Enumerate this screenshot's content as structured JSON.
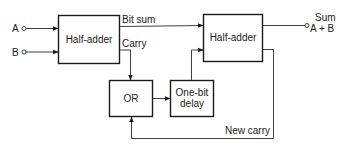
{
  "diagram": {
    "type": "block-diagram",
    "inputs": [
      {
        "id": "A",
        "label": "A"
      },
      {
        "id": "B",
        "label": "B"
      }
    ],
    "blocks": [
      {
        "id": "ha1",
        "label": "Half-adder"
      },
      {
        "id": "ha2",
        "label": "Half-adder"
      },
      {
        "id": "or",
        "label": "OR"
      },
      {
        "id": "delay",
        "label_line1": "One-bit",
        "label_line2": "delay"
      }
    ],
    "signals": {
      "bit_sum": "Bit sum",
      "carry": "Carry",
      "new_carry": "New carry"
    },
    "output": {
      "label_line1": "Sum",
      "label_line2": "A + B"
    },
    "edges": [
      {
        "from": "A",
        "to": "ha1"
      },
      {
        "from": "B",
        "to": "ha1"
      },
      {
        "from": "ha1",
        "to": "ha2",
        "label": "Bit sum"
      },
      {
        "from": "ha1",
        "to": "or",
        "label": "Carry"
      },
      {
        "from": "or",
        "to": "delay"
      },
      {
        "from": "delay",
        "to": "ha2"
      },
      {
        "from": "ha2",
        "to": "output",
        "label": "Sum A + B"
      },
      {
        "from": "ha2",
        "to": "or",
        "label": "New carry"
      }
    ]
  }
}
